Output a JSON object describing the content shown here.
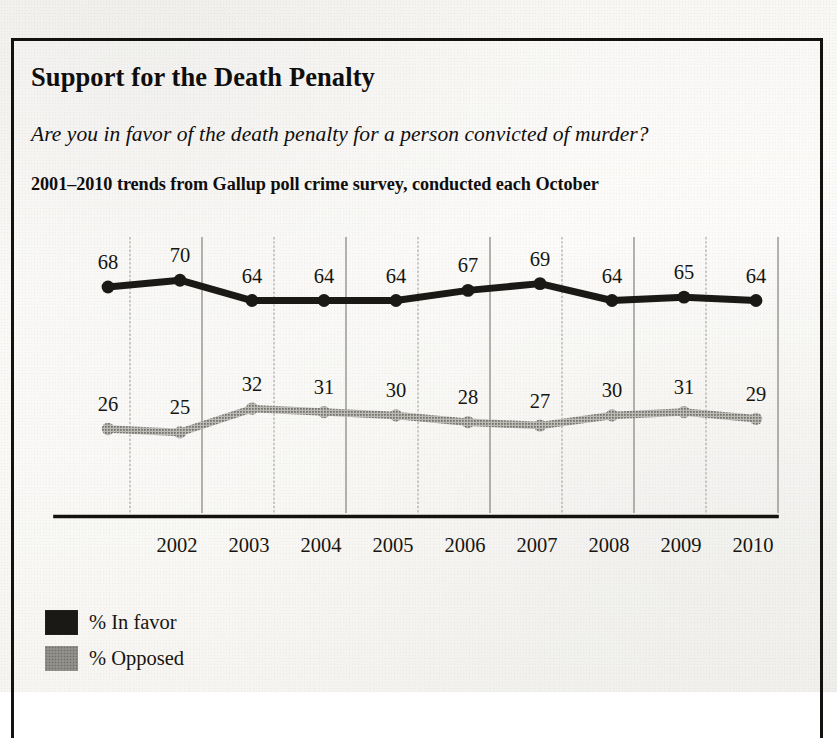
{
  "figure": {
    "title": "Support for the Death Penalty",
    "subtitle": "Are you in favor of the death penalty for a person convicted of murder?",
    "caption": "2001–2010 trends from Gallup poll crime survey, conducted each October"
  },
  "legend": {
    "items": [
      {
        "label": "% In favor",
        "color": "#1b1916",
        "swatch": "favor"
      },
      {
        "label": "% Opposed",
        "color": "#9a9a9a",
        "swatch": "opposed"
      }
    ]
  },
  "chart_data": {
    "type": "line",
    "title": "Support for the Death Penalty",
    "subtitle": "Are you in favor of the death penalty for a person convicted of murder?",
    "annotation": "2001–2010 trends from Gallup poll crime survey, conducted each October",
    "xlabel": "",
    "ylabel": "",
    "x": [
      2001,
      2002,
      2003,
      2004,
      2005,
      2006,
      2007,
      2008,
      2009,
      2010
    ],
    "categories": [
      "2001",
      "2002",
      "2003",
      "2004",
      "2005",
      "2006",
      "2007",
      "2008",
      "2009",
      "2010"
    ],
    "tick_labels": [
      "2002",
      "2003",
      "2004",
      "2005",
      "2006",
      "2007",
      "2008",
      "2009",
      "2010"
    ],
    "ylim": [
      0,
      100
    ],
    "grid": true,
    "grid_axis": "x",
    "legend_position": "below-left",
    "series": [
      {
        "name": "% In favor",
        "color": "#1b1916",
        "values": [
          68,
          70,
          64,
          64,
          64,
          67,
          69,
          64,
          65,
          64
        ],
        "labels": [
          "68",
          "70",
          "64",
          "64",
          "64",
          "67",
          "69",
          "64",
          "65",
          "64"
        ]
      },
      {
        "name": "% Opposed",
        "color": "#9a9a9a",
        "values": [
          26,
          25,
          32,
          31,
          30,
          28,
          27,
          30,
          31,
          29
        ],
        "labels": [
          "26",
          "25",
          "32",
          "31",
          "30",
          "28",
          "27",
          "30",
          "31",
          "29"
        ]
      }
    ]
  }
}
